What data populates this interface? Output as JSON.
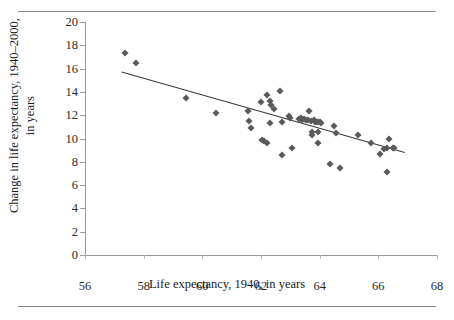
{
  "figure": {
    "rules": {
      "top": "horizontal-rule",
      "bottom": "horizontal-rule"
    }
  },
  "chart_data": {
    "type": "scatter",
    "title": "",
    "xlabel": "Life expectancy, 1940, in years",
    "ylabel_line1": "Change in life expectancy, 1940–2000,",
    "ylabel_line2": "in years",
    "xlim": [
      56,
      68
    ],
    "ylim": [
      0,
      20
    ],
    "xticks": [
      56,
      58,
      60,
      62,
      64,
      66,
      68
    ],
    "yticks": [
      0,
      2,
      4,
      6,
      8,
      10,
      12,
      14,
      16,
      18,
      20
    ],
    "grid": false,
    "legend": "none",
    "marker": "diamond",
    "marker_color": "#5a5a5a",
    "line_color": "#3a3a3a",
    "points": [
      [
        57.35,
        17.3
      ],
      [
        57.75,
        16.5
      ],
      [
        59.45,
        13.5
      ],
      [
        60.45,
        12.2
      ],
      [
        61.55,
        12.4
      ],
      [
        61.6,
        11.5
      ],
      [
        61.65,
        10.9
      ],
      [
        62.0,
        13.1
      ],
      [
        62.05,
        9.9
      ],
      [
        62.1,
        9.75
      ],
      [
        62.2,
        13.7
      ],
      [
        62.2,
        9.6
      ],
      [
        62.3,
        13.2
      ],
      [
        62.35,
        12.9
      ],
      [
        62.3,
        11.35
      ],
      [
        62.45,
        12.55
      ],
      [
        62.65,
        14.05
      ],
      [
        62.7,
        11.45
      ],
      [
        62.7,
        8.55
      ],
      [
        62.95,
        11.95
      ],
      [
        63.0,
        11.75
      ],
      [
        63.05,
        9.15
      ],
      [
        63.3,
        11.7
      ],
      [
        63.35,
        11.75
      ],
      [
        63.4,
        11.6
      ],
      [
        63.45,
        11.7
      ],
      [
        63.55,
        11.55
      ],
      [
        63.6,
        11.55
      ],
      [
        63.65,
        12.4
      ],
      [
        63.7,
        11.5
      ],
      [
        63.75,
        10.6
      ],
      [
        63.75,
        10.3
      ],
      [
        63.8,
        11.55
      ],
      [
        63.85,
        11.45
      ],
      [
        63.9,
        11.45
      ],
      [
        63.95,
        11.4
      ],
      [
        63.95,
        10.55
      ],
      [
        64.0,
        11.4
      ],
      [
        64.05,
        11.35
      ],
      [
        63.95,
        9.6
      ],
      [
        64.35,
        7.8
      ],
      [
        64.5,
        11.1
      ],
      [
        64.55,
        10.5
      ],
      [
        64.7,
        7.45
      ],
      [
        65.3,
        10.3
      ],
      [
        65.75,
        9.6
      ],
      [
        66.05,
        8.65
      ],
      [
        66.2,
        9.1
      ],
      [
        66.3,
        9.15
      ],
      [
        66.35,
        10.0
      ],
      [
        66.3,
        7.1
      ],
      [
        66.5,
        9.2
      ],
      [
        66.55,
        9.15
      ]
    ],
    "trendline": {
      "x1": 57.25,
      "y1": 15.7,
      "x2": 66.9,
      "y2": 8.8
    }
  }
}
